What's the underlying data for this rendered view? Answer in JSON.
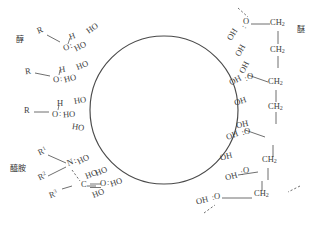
{
  "diagram": {
    "central_shape": {
      "name": "circle",
      "cx": 164,
      "cy": 110,
      "r": 74,
      "stroke": "#4a4a4a"
    },
    "group_labels": {
      "alcohol": "醇",
      "amide": "醯胺",
      "ether": "醚"
    },
    "alcohol_units": [
      {
        "r": "R",
        "h": "H",
        "o": "O",
        "bond": "—"
      },
      {
        "r": "R",
        "h": "H",
        "o": "O",
        "bond": "—"
      },
      {
        "r": "R",
        "h": "H",
        "o": "O",
        "bond": "—"
      }
    ],
    "amide_unit": {
      "r1": "R",
      "r1_sup": "1",
      "r2": "R",
      "r2_sup": "2",
      "r3": "R",
      "r3_sup": "3",
      "n": "N",
      "c": "C",
      "o": "O",
      "double_bond": "=",
      "bond": "—"
    },
    "ether_units": [
      {
        "o": "O",
        "ch2": "CH",
        "ch2_sub": "2",
        "bond": "—"
      },
      {
        "o": "O",
        "ch2": "CH",
        "ch2_sub": "2",
        "bond": "—"
      },
      {
        "o": "O",
        "ch2": "CH",
        "ch2_sub": "2",
        "bond": "—"
      },
      {
        "o": "O",
        "ch2": "CH",
        "ch2_sub": "2",
        "bond": "—"
      },
      {
        "o": "O",
        "ch2": "CH",
        "ch2_sub": "2",
        "bond": "—"
      },
      {
        "o": "O",
        "ch2": "CH",
        "ch2_sub": "2",
        "bond": "—"
      }
    ],
    "hydroxyls_left": [
      "HO",
      "HO",
      "HO",
      "HO",
      "HO",
      "HO",
      "HO",
      "HO",
      "HO"
    ],
    "hydroxyls_right": [
      "OH",
      "OH",
      "OH",
      "OH",
      "OH",
      "OH",
      "OH",
      "OH"
    ],
    "hbond_marker": ":",
    "colors": {
      "line": "#4a4a4a",
      "text": "#3d3d3d"
    }
  }
}
